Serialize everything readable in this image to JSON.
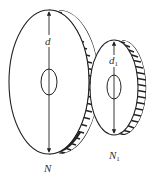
{
  "diagram": {
    "stroke_color": "#222222",
    "background": "#ffffff",
    "large_gear": {
      "diameter_label": "d",
      "teeth_label": "N",
      "teeth_label_sub": ""
    },
    "small_gear": {
      "diameter_label": "d",
      "diameter_label_sub": "1",
      "teeth_label": "N",
      "teeth_label_sub": "1"
    }
  }
}
